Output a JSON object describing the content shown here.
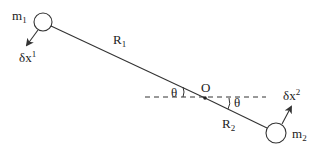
{
  "diagram": {
    "type": "two-body rotating rod with virtual displacements",
    "colors": {
      "stroke": "#333333",
      "background": "#ffffff",
      "text": "#222222"
    },
    "masses": [
      {
        "label": "m",
        "subscript": "1",
        "cx": 43,
        "cy": 22,
        "r": 9
      },
      {
        "label": "m",
        "subscript": "2",
        "cx": 276,
        "cy": 133,
        "r": 10
      }
    ],
    "pivot": {
      "label": "O",
      "x": 205,
      "y": 98
    },
    "arms": [
      {
        "label": "R",
        "subscript": "1"
      },
      {
        "label": "R",
        "subscript": "2"
      }
    ],
    "angles": [
      {
        "label": "θ"
      },
      {
        "label": "θ"
      }
    ],
    "displacements": [
      {
        "label": "δx",
        "superscript": "1"
      },
      {
        "label": "δx",
        "superscript": "2"
      }
    ],
    "reference_line": {
      "style": "dashed",
      "x1": 145,
      "x2": 266,
      "y": 97
    }
  }
}
